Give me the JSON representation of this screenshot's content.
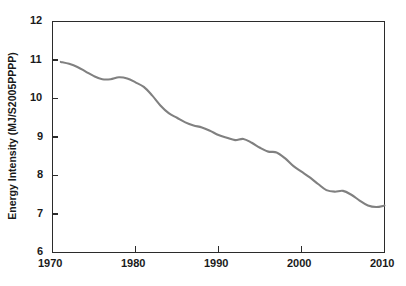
{
  "chart_data": {
    "type": "line",
    "title": "",
    "xlabel": "",
    "ylabel": "Energy Intensity (MJ/S2005PPPP)",
    "xlim": [
      1970,
      2010
    ],
    "ylim": [
      6,
      12
    ],
    "xticks": [
      1970,
      1980,
      1990,
      2000,
      2010
    ],
    "yticks": [
      6,
      7,
      8,
      9,
      10,
      11,
      12
    ],
    "grid": false,
    "legend": false,
    "series": [
      {
        "name": "Energy Intensity",
        "color": "#808080",
        "x": [
          1971,
          1972,
          1973,
          1974,
          1975,
          1976,
          1977,
          1978,
          1979,
          1980,
          1981,
          1982,
          1983,
          1984,
          1985,
          1986,
          1987,
          1988,
          1989,
          1990,
          1991,
          1992,
          1993,
          1994,
          1995,
          1996,
          1997,
          1998,
          1999,
          2000,
          2001,
          2002,
          2003,
          2004,
          2005,
          2006,
          2007,
          2008,
          2009,
          2010
        ],
        "values": [
          10.95,
          10.9,
          10.82,
          10.7,
          10.58,
          10.5,
          10.5,
          10.55,
          10.52,
          10.42,
          10.3,
          10.08,
          9.82,
          9.62,
          9.5,
          9.38,
          9.3,
          9.25,
          9.16,
          9.05,
          8.98,
          8.92,
          8.95,
          8.85,
          8.72,
          8.62,
          8.6,
          8.45,
          8.25,
          8.1,
          7.95,
          7.78,
          7.62,
          7.58,
          7.6,
          7.5,
          7.35,
          7.22,
          7.18,
          7.22
        ]
      }
    ]
  },
  "axes": {
    "x_tick_labels": [
      "1970",
      "1980",
      "1990",
      "2000",
      "2010"
    ],
    "y_tick_labels": [
      "12",
      "11",
      "10",
      "9",
      "8",
      "7",
      "6"
    ],
    "y_axis_title": "Energy Intensity (MJ/S2005PPPP)"
  },
  "colors": {
    "line": "#808080",
    "axis": "#2b2b2b",
    "text": "#1a1a1a",
    "background": "#ffffff"
  }
}
